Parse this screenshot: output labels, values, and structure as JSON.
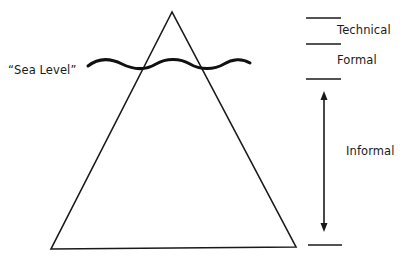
{
  "diagram": {
    "sea_level_label": "“Sea Level”",
    "levels": [
      {
        "label": "Technical"
      },
      {
        "label": "Formal"
      },
      {
        "label": "Informal"
      }
    ],
    "colors": {
      "stroke": "#1a1a1a",
      "background": "#ffffff",
      "text": "#1a1a1a"
    }
  }
}
